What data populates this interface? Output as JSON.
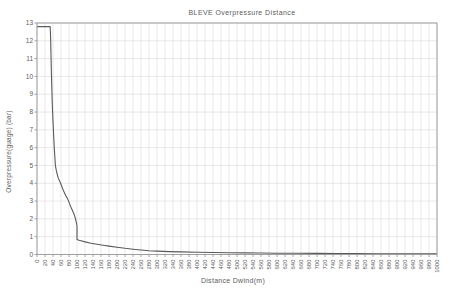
{
  "chart_data": {
    "type": "line",
    "title": "BLEVE Overpressure Distance",
    "xlabel": "Distance Dwind(m)",
    "ylabel": "Overpressure(guage) (bar)",
    "xlim": [
      0,
      1000
    ],
    "ylim": [
      0,
      13
    ],
    "grid": true,
    "legend": "none",
    "x_ticks": [
      0,
      20,
      40,
      60,
      80,
      100,
      120,
      140,
      160,
      180,
      200,
      220,
      240,
      260,
      280,
      300,
      320,
      340,
      360,
      380,
      400,
      420,
      440,
      460,
      480,
      500,
      520,
      540,
      560,
      580,
      600,
      620,
      640,
      660,
      680,
      700,
      720,
      740,
      760,
      780,
      800,
      820,
      840,
      860,
      880,
      900,
      920,
      940,
      960,
      980,
      1000
    ],
    "y_ticks": [
      0,
      1,
      2,
      3,
      4,
      5,
      6,
      7,
      8,
      9,
      10,
      11,
      12,
      13
    ],
    "series": [
      {
        "name": "overpressure-vs-distance",
        "points": [
          [
            0,
            12.8
          ],
          [
            33,
            12.8
          ],
          [
            34,
            12.2
          ],
          [
            35,
            11.2
          ],
          [
            36,
            10.2
          ],
          [
            37,
            9.4
          ],
          [
            38,
            8.6
          ],
          [
            39,
            8.0
          ],
          [
            40,
            7.5
          ],
          [
            41,
            7.0
          ],
          [
            42,
            6.5
          ],
          [
            43,
            6.1
          ],
          [
            44,
            5.7
          ],
          [
            45,
            5.35
          ],
          [
            46,
            5.0
          ],
          [
            48,
            4.75
          ],
          [
            50,
            4.55
          ],
          [
            53,
            4.3
          ],
          [
            56,
            4.15
          ],
          [
            60,
            3.95
          ],
          [
            64,
            3.7
          ],
          [
            68,
            3.5
          ],
          [
            72,
            3.3
          ],
          [
            76,
            3.15
          ],
          [
            79,
            3.0
          ],
          [
            84,
            2.7
          ],
          [
            88,
            2.5
          ],
          [
            92,
            2.3
          ],
          [
            95,
            2.1
          ],
          [
            98,
            1.85
          ],
          [
            100,
            1.6
          ],
          [
            100,
            0.85
          ],
          [
            105,
            0.8
          ],
          [
            110,
            0.77
          ],
          [
            120,
            0.71
          ],
          [
            135,
            0.63
          ],
          [
            150,
            0.57
          ],
          [
            165,
            0.52
          ],
          [
            180,
            0.47
          ],
          [
            200,
            0.41
          ],
          [
            220,
            0.35
          ],
          [
            240,
            0.3
          ],
          [
            260,
            0.25
          ],
          [
            280,
            0.21
          ],
          [
            300,
            0.19
          ],
          [
            330,
            0.165
          ],
          [
            360,
            0.145
          ],
          [
            400,
            0.125
          ],
          [
            440,
            0.11
          ],
          [
            480,
            0.1
          ],
          [
            520,
            0.09
          ],
          [
            560,
            0.082
          ],
          [
            600,
            0.075
          ],
          [
            650,
            0.067
          ],
          [
            700,
            0.06
          ],
          [
            750,
            0.055
          ],
          [
            800,
            0.05
          ],
          [
            850,
            0.046
          ],
          [
            900,
            0.042
          ],
          [
            950,
            0.039
          ],
          [
            1000,
            0.036
          ]
        ]
      }
    ],
    "colors": {
      "line": "#5a5a5a",
      "grid": "#dedede",
      "border": "#9e9e9e",
      "tick": "#8a8a8a",
      "text": "#5c5c5c",
      "background": "#ffffff"
    }
  }
}
